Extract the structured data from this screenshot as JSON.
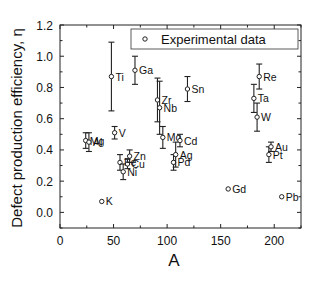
{
  "chart_data": {
    "type": "scatter",
    "title": "",
    "xlabel": "A",
    "ylabel": "Defect production efficiency, η",
    "xlim": [
      0,
      225
    ],
    "ylim": [
      -0.1,
      1.2
    ],
    "xticks": [
      0,
      50,
      100,
      150,
      200
    ],
    "yticks": [
      0.0,
      0.2,
      0.4,
      0.6,
      0.8,
      1.0,
      1.2
    ],
    "xtick_labels": [
      "0",
      "50",
      "100",
      "150",
      "200"
    ],
    "ytick_labels": [
      "0.0",
      "0.2",
      "0.4",
      "0.6",
      "0.8",
      "1.0",
      "1.2"
    ],
    "grid": false,
    "legend": {
      "position": "upper right",
      "entries": [
        "Experimental data"
      ]
    },
    "series": [
      {
        "name": "Experimental data",
        "marker": "open-circle",
        "points": [
          {
            "label": "K",
            "x": 39,
            "y": 0.07,
            "err": 0.0
          },
          {
            "label": "Mg",
            "x": 24,
            "y": 0.46,
            "err": 0.05
          },
          {
            "label": "Al",
            "x": 27,
            "y": 0.45,
            "err": 0.06
          },
          {
            "label": "Ti",
            "x": 48,
            "y": 0.87,
            "err": 0.22
          },
          {
            "label": "V",
            "x": 51,
            "y": 0.51,
            "err": 0.04
          },
          {
            "label": "Fe",
            "x": 56,
            "y": 0.32,
            "err": 0.05
          },
          {
            "label": "Ni",
            "x": 59,
            "y": 0.26,
            "err": 0.05
          },
          {
            "label": "Cu",
            "x": 63,
            "y": 0.31,
            "err": 0.03
          },
          {
            "label": "Zn",
            "x": 65,
            "y": 0.36,
            "err": 0.04
          },
          {
            "label": "Ga",
            "x": 70,
            "y": 0.91,
            "err": 0.09
          },
          {
            "label": "Zr",
            "x": 91,
            "y": 0.72,
            "err": 0.14
          },
          {
            "label": "Nb",
            "x": 93,
            "y": 0.67,
            "err": 0.17
          },
          {
            "label": "Mo",
            "x": 96,
            "y": 0.48,
            "err": 0.07
          },
          {
            "label": "Pd",
            "x": 106,
            "y": 0.32,
            "err": 0.05
          },
          {
            "label": "Ag",
            "x": 108,
            "y": 0.37,
            "err": 0.08
          },
          {
            "label": "Cd",
            "x": 112,
            "y": 0.46,
            "err": 0.04
          },
          {
            "label": "Sn",
            "x": 119,
            "y": 0.79,
            "err": 0.08
          },
          {
            "label": "Gd",
            "x": 157,
            "y": 0.15,
            "err": 0.0
          },
          {
            "label": "Ta",
            "x": 181,
            "y": 0.73,
            "err": 0.09
          },
          {
            "label": "W",
            "x": 184,
            "y": 0.61,
            "err": 0.09
          },
          {
            "label": "Re",
            "x": 186,
            "y": 0.87,
            "err": 0.08
          },
          {
            "label": "Pt",
            "x": 195,
            "y": 0.37,
            "err": 0.05
          },
          {
            "label": "Au",
            "x": 197,
            "y": 0.42,
            "err": 0.03
          },
          {
            "label": "Pb",
            "x": 207,
            "y": 0.1,
            "err": 0.0
          }
        ]
      }
    ],
    "colors": {
      "marker": "#222222",
      "axis": "#222222",
      "background": "#ffffff"
    }
  },
  "labels": {
    "xlabel": "A",
    "ylabel": "Defect production efficiency, η",
    "legend": "Experimental data"
  }
}
